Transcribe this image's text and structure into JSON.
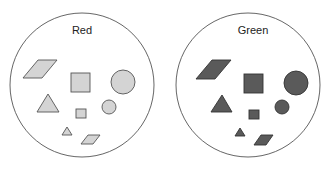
{
  "diagram": {
    "sets": [
      {
        "label": "Red",
        "fill": "#d4d4d4",
        "stroke": "#555555",
        "cx": 82,
        "cy": 85,
        "r": 72
      },
      {
        "label": "Green",
        "fill": "#5a5a5a",
        "stroke": "#333333",
        "cx": 248,
        "cy": 85,
        "r": 72
      }
    ],
    "shapes": [
      "large parallelogram",
      "large square",
      "large circle",
      "large triangle",
      "small square",
      "small circle",
      "small triangle",
      "small parallelogram"
    ],
    "caption": "",
    "outline_color": "#555555",
    "background": "#ffffff"
  }
}
